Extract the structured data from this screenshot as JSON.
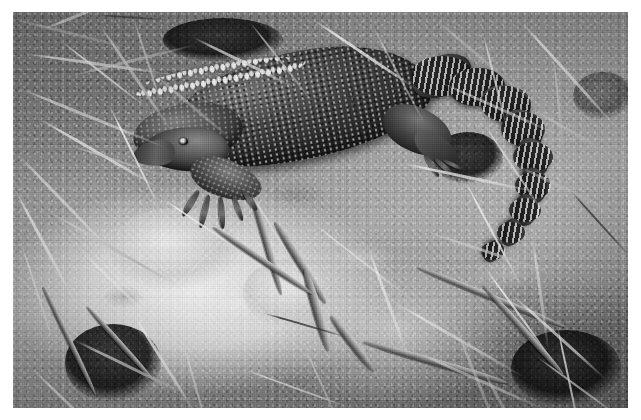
{
  "page": {
    "background_color": "#ffffff",
    "width": 641,
    "height": 420,
    "caption": ""
  },
  "photo": {
    "title": "",
    "subject": "monitor lizard (goanna) on dry ground",
    "color_mode": "black and white",
    "frame": {
      "left": 13,
      "top": 12,
      "width": 615,
      "height": 396
    },
    "border_color": "#ffffff",
    "palette": {
      "highlight": "#f2f0ea",
      "soil_light": "#ded9cf",
      "soil_mid": "#a6a197",
      "soil_dark": "#76726a",
      "debris_dark": "#3a3630",
      "animal_dark": "#2e2a26",
      "animal_mid": "#5e584f",
      "ocellus_white": "#f4f2ec"
    },
    "subject_elements": [
      {
        "name": "head",
        "note": "facing lower-left"
      },
      {
        "name": "eye",
        "note": "small dark eye"
      },
      {
        "name": "neck",
        "note": "granular scales"
      },
      {
        "name": "body",
        "note": "dark dorsum with pale speckles"
      },
      {
        "name": "flank-ocelli",
        "note": "row of bright white spots along lower flank"
      },
      {
        "name": "foreleg",
        "note": "clawed front foot splayed on ground"
      },
      {
        "name": "hindleg",
        "note": "bent hind limb"
      },
      {
        "name": "tail",
        "note": "long banded tail arcing to the right then down"
      }
    ],
    "background_elements": [
      {
        "name": "straw",
        "note": "pale dry grass stems scattered across frame"
      },
      {
        "name": "twigs",
        "note": "woody sticks crossing lower centre"
      },
      {
        "name": "bare-soil",
        "note": "light cracked earth patch at lower left"
      },
      {
        "name": "grass-clump",
        "note": "dark tussock at lower left and lower right"
      }
    ]
  },
  "straws": [
    {
      "x": 2,
      "y": 6,
      "len": 120,
      "rot": 14,
      "w": 3.2,
      "tone": "md"
    },
    {
      "x": 30,
      "y": 16,
      "len": 92,
      "rot": -22,
      "w": 2.6,
      "tone": "lt"
    },
    {
      "x": 10,
      "y": 40,
      "len": 150,
      "rot": 8,
      "w": 3.0,
      "tone": "lt"
    },
    {
      "x": 48,
      "y": 28,
      "len": 108,
      "rot": 38,
      "w": 2.4,
      "tone": "lt"
    },
    {
      "x": 86,
      "y": 10,
      "len": 132,
      "rot": 56,
      "w": 2.8,
      "tone": "md"
    },
    {
      "x": 120,
      "y": 4,
      "len": 96,
      "rot": 72,
      "w": 2.2,
      "tone": "lt"
    },
    {
      "x": 4,
      "y": 74,
      "len": 160,
      "rot": 22,
      "w": 3.4,
      "tone": "lt"
    },
    {
      "x": 60,
      "y": 62,
      "len": 126,
      "rot": -14,
      "w": 2.6,
      "tone": "md"
    },
    {
      "x": 24,
      "y": 104,
      "len": 144,
      "rot": 30,
      "w": 3.0,
      "tone": "lt"
    },
    {
      "x": 96,
      "y": 92,
      "len": 118,
      "rot": 64,
      "w": 2.4,
      "tone": "lt"
    },
    {
      "x": 140,
      "y": 60,
      "len": 104,
      "rot": 40,
      "w": 2.6,
      "tone": "md"
    },
    {
      "x": 4,
      "y": 140,
      "len": 136,
      "rot": 46,
      "w": 2.8,
      "tone": "lt"
    },
    {
      "x": 56,
      "y": 132,
      "len": 112,
      "rot": 18,
      "w": 2.4,
      "tone": "md"
    },
    {
      "x": 2,
      "y": 176,
      "len": 128,
      "rot": 62,
      "w": 3.0,
      "tone": "lt"
    },
    {
      "x": 36,
      "y": 198,
      "len": 148,
      "rot": 30,
      "w": 2.6,
      "tone": "md"
    },
    {
      "x": 8,
      "y": 230,
      "len": 110,
      "rot": 72,
      "w": 2.4,
      "tone": "lt"
    },
    {
      "x": 70,
      "y": 240,
      "len": 96,
      "rot": 44,
      "w": 2.2,
      "tone": "lt"
    },
    {
      "x": 180,
      "y": 24,
      "len": 116,
      "rot": 26,
      "w": 2.6,
      "tone": "lt"
    },
    {
      "x": 236,
      "y": 8,
      "len": 104,
      "rot": 52,
      "w": 2.4,
      "tone": "md"
    },
    {
      "x": 300,
      "y": 6,
      "len": 124,
      "rot": 34,
      "w": 2.8,
      "tone": "lt"
    },
    {
      "x": 360,
      "y": 14,
      "len": 110,
      "rot": 62,
      "w": 2.4,
      "tone": "lt"
    },
    {
      "x": 420,
      "y": 4,
      "len": 130,
      "rot": 40,
      "w": 2.6,
      "tone": "md"
    },
    {
      "x": 470,
      "y": 20,
      "len": 96,
      "rot": 76,
      "w": 2.2,
      "tone": "lt"
    },
    {
      "x": 508,
      "y": 8,
      "len": 140,
      "rot": 48,
      "w": 2.8,
      "tone": "lt"
    },
    {
      "x": 540,
      "y": 40,
      "len": 118,
      "rot": 84,
      "w": 2.4,
      "tone": "md"
    },
    {
      "x": 430,
      "y": 70,
      "len": 126,
      "rot": 24,
      "w": 2.6,
      "tone": "lt"
    },
    {
      "x": 470,
      "y": 110,
      "len": 112,
      "rot": 56,
      "w": 2.4,
      "tone": "lt"
    },
    {
      "x": 520,
      "y": 96,
      "len": 104,
      "rot": 30,
      "w": 2.6,
      "tone": "md"
    },
    {
      "x": 390,
      "y": 150,
      "len": 134,
      "rot": 12,
      "w": 2.8,
      "tone": "lt"
    },
    {
      "x": 452,
      "y": 168,
      "len": 120,
      "rot": 62,
      "w": 2.4,
      "tone": "lt"
    },
    {
      "x": 500,
      "y": 150,
      "len": 140,
      "rot": 26,
      "w": 2.6,
      "tone": "md"
    },
    {
      "x": 300,
      "y": 210,
      "len": 128,
      "rot": 38,
      "w": 2.4,
      "tone": "lt"
    },
    {
      "x": 356,
      "y": 236,
      "len": 116,
      "rot": 70,
      "w": 2.6,
      "tone": "lt"
    },
    {
      "x": 412,
      "y": 218,
      "len": 146,
      "rot": 18,
      "w": 3.0,
      "tone": "md"
    },
    {
      "x": 470,
      "y": 252,
      "len": 124,
      "rot": 54,
      "w": 2.4,
      "tone": "lt"
    },
    {
      "x": 520,
      "y": 226,
      "len": 112,
      "rot": 82,
      "w": 2.6,
      "tone": "lt"
    },
    {
      "x": 380,
      "y": 288,
      "len": 152,
      "rot": 30,
      "w": 3.0,
      "tone": "lt"
    },
    {
      "x": 440,
      "y": 306,
      "len": 134,
      "rot": 68,
      "w": 2.6,
      "tone": "md"
    },
    {
      "x": 500,
      "y": 282,
      "len": 126,
      "rot": 42,
      "w": 2.8,
      "tone": "lt"
    },
    {
      "x": 544,
      "y": 312,
      "len": 110,
      "rot": 78,
      "w": 2.4,
      "tone": "lt"
    },
    {
      "x": 406,
      "y": 340,
      "len": 142,
      "rot": 24,
      "w": 2.8,
      "tone": "lt"
    },
    {
      "x": 468,
      "y": 352,
      "len": 120,
      "rot": 62,
      "w": 2.6,
      "tone": "md"
    },
    {
      "x": 524,
      "y": 344,
      "len": 104,
      "rot": 36,
      "w": 2.4,
      "tone": "lt"
    },
    {
      "x": 120,
      "y": 300,
      "len": 118,
      "rot": 58,
      "w": 2.6,
      "tone": "lt"
    },
    {
      "x": 60,
      "y": 326,
      "len": 132,
      "rot": 26,
      "w": 2.8,
      "tone": "md"
    },
    {
      "x": 170,
      "y": 330,
      "len": 108,
      "rot": 74,
      "w": 2.4,
      "tone": "lt"
    },
    {
      "x": 20,
      "y": 356,
      "len": 126,
      "rot": 44,
      "w": 2.6,
      "tone": "lt"
    },
    {
      "x": 230,
      "y": 356,
      "len": 116,
      "rot": 20,
      "w": 2.4,
      "tone": "lt"
    },
    {
      "x": 290,
      "y": 330,
      "len": 104,
      "rot": 66,
      "w": 2.2,
      "tone": "md"
    },
    {
      "x": 150,
      "y": 186,
      "len": 96,
      "rot": 34,
      "w": 2.2,
      "tone": "lt"
    },
    {
      "x": 236,
      "y": 178,
      "len": 86,
      "rot": 58,
      "w": 2.0,
      "tone": "lt"
    },
    {
      "x": 84,
      "y": 2,
      "len": 74,
      "rot": 4,
      "w": 2.0,
      "tone": "dk"
    },
    {
      "x": 330,
      "y": 64,
      "len": 82,
      "rot": 70,
      "w": 2.0,
      "tone": "dk"
    },
    {
      "x": 556,
      "y": 176,
      "len": 92,
      "rot": 48,
      "w": 2.2,
      "tone": "dk"
    },
    {
      "x": 250,
      "y": 300,
      "len": 88,
      "rot": 16,
      "w": 2.0,
      "tone": "dk"
    }
  ],
  "twigs": [
    {
      "x": 236,
      "y": 166,
      "len": 118,
      "rot": 74,
      "w": 7
    },
    {
      "x": 262,
      "y": 206,
      "len": 96,
      "rot": 58,
      "w": 8
    },
    {
      "x": 292,
      "y": 252,
      "len": 86,
      "rot": 74,
      "w": 9
    },
    {
      "x": 318,
      "y": 300,
      "len": 70,
      "rot": 52,
      "w": 8
    },
    {
      "x": 200,
      "y": 212,
      "len": 120,
      "rot": 34,
      "w": 6
    },
    {
      "x": 350,
      "y": 326,
      "len": 150,
      "rot": 16,
      "w": 7
    },
    {
      "x": 404,
      "y": 252,
      "len": 160,
      "rot": 22,
      "w": 6
    },
    {
      "x": 470,
      "y": 270,
      "len": 120,
      "rot": 48,
      "w": 6
    },
    {
      "x": 30,
      "y": 272,
      "len": 120,
      "rot": 64,
      "w": 5
    },
    {
      "x": 74,
      "y": 292,
      "len": 100,
      "rot": 48,
      "w": 5
    }
  ],
  "clumps": [
    {
      "x": 52,
      "y": 312,
      "w": 96,
      "h": 78,
      "tone": "dark"
    },
    {
      "x": 420,
      "y": 120,
      "w": 70,
      "h": 52,
      "tone": "dark"
    },
    {
      "x": 498,
      "y": 318,
      "w": 110,
      "h": 76,
      "tone": "dark"
    },
    {
      "x": 150,
      "y": 6,
      "w": 120,
      "h": 44,
      "tone": "dark"
    },
    {
      "x": 560,
      "y": 60,
      "w": 60,
      "h": 48,
      "tone": "mid"
    },
    {
      "x": 96,
      "y": 196,
      "w": 130,
      "h": 82,
      "tone": "light"
    },
    {
      "x": 230,
      "y": 246,
      "w": 100,
      "h": 70,
      "tone": "light"
    }
  ],
  "tail_segments": [
    {
      "x": 398,
      "y": 44,
      "w": 62,
      "h": 40,
      "rot": -24
    },
    {
      "x": 436,
      "y": 56,
      "w": 56,
      "h": 38,
      "rot": -6
    },
    {
      "x": 468,
      "y": 74,
      "w": 50,
      "h": 36,
      "rot": 18
    },
    {
      "x": 488,
      "y": 100,
      "w": 44,
      "h": 34,
      "rot": 44
    },
    {
      "x": 500,
      "y": 130,
      "w": 40,
      "h": 30,
      "rot": 64
    },
    {
      "x": 502,
      "y": 160,
      "w": 36,
      "h": 27,
      "rot": 80
    },
    {
      "x": 496,
      "y": 186,
      "w": 32,
      "h": 24,
      "rot": 96
    },
    {
      "x": 484,
      "y": 210,
      "w": 28,
      "h": 21,
      "rot": 110
    },
    {
      "x": 468,
      "y": 230,
      "w": 24,
      "h": 18,
      "rot": 124
    }
  ],
  "toes": [
    {
      "x": 186,
      "y": 176,
      "len": 30,
      "rot": 122,
      "w": 6
    },
    {
      "x": 196,
      "y": 180,
      "len": 34,
      "rot": 104,
      "w": 6
    },
    {
      "x": 208,
      "y": 182,
      "len": 32,
      "rot": 86,
      "w": 5.5
    },
    {
      "x": 220,
      "y": 180,
      "len": 28,
      "rot": 70,
      "w": 5
    },
    {
      "x": 230,
      "y": 176,
      "len": 24,
      "rot": 54,
      "w": 4.5
    },
    {
      "x": 412,
      "y": 140,
      "len": 26,
      "rot": 58,
      "w": 5
    },
    {
      "x": 422,
      "y": 144,
      "len": 24,
      "rot": 42,
      "w": 4.5
    },
    {
      "x": 430,
      "y": 146,
      "len": 22,
      "rot": 26,
      "w": 4
    }
  ]
}
